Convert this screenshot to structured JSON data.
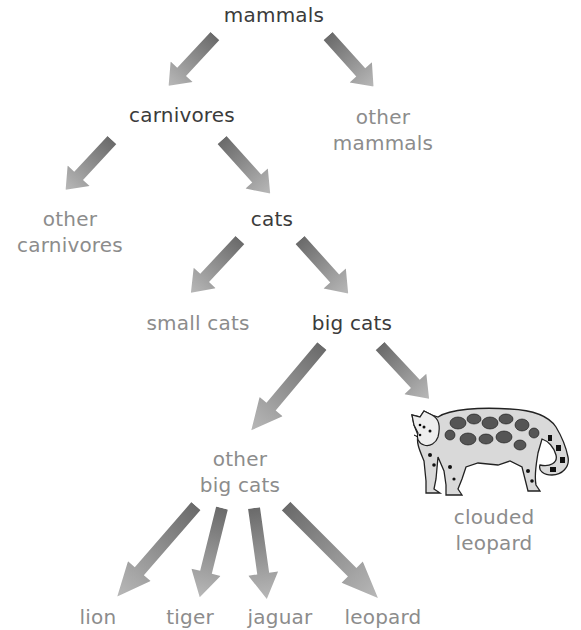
{
  "colors": {
    "main_text": "#3b3b3b",
    "other_text": "#8c8c8c",
    "arrow_start": "#6e6e6e",
    "arrow_end": "#b5b5b5"
  },
  "nodes": {
    "mammals": {
      "text": "mammals"
    },
    "carnivores": {
      "text": "carnivores"
    },
    "other_mammals": {
      "line1": "other",
      "line2": "mammals"
    },
    "other_carnivores": {
      "line1": "other",
      "line2": "carnivores"
    },
    "cats": {
      "text": "cats"
    },
    "small_cats": {
      "text": "small cats"
    },
    "big_cats": {
      "text": "big cats"
    },
    "other_big_cats": {
      "line1": "other",
      "line2": "big cats"
    },
    "clouded_leopard": {
      "line1": "clouded",
      "line2": "leopard",
      "image": "clouded-leopard-illustration"
    },
    "lion": {
      "text": "lion"
    },
    "tiger": {
      "text": "tiger"
    },
    "jaguar": {
      "text": "jaguar"
    },
    "leopard": {
      "text": "leopard"
    }
  },
  "edges": [
    [
      "mammals",
      "carnivores"
    ],
    [
      "mammals",
      "other_mammals"
    ],
    [
      "carnivores",
      "other_carnivores"
    ],
    [
      "carnivores",
      "cats"
    ],
    [
      "cats",
      "small_cats"
    ],
    [
      "cats",
      "big_cats"
    ],
    [
      "big_cats",
      "other_big_cats"
    ],
    [
      "big_cats",
      "clouded_leopard"
    ],
    [
      "other_big_cats",
      "lion"
    ],
    [
      "other_big_cats",
      "tiger"
    ],
    [
      "other_big_cats",
      "jaguar"
    ],
    [
      "other_big_cats",
      "leopard"
    ]
  ]
}
